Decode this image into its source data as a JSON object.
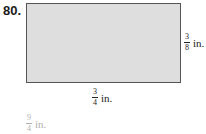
{
  "problem": {
    "number": "80.",
    "shape": "rectangle",
    "fill_color": "#dedede",
    "border_color": "#555555",
    "height_label": {
      "numerator": "3",
      "denominator": "8",
      "unit": "in."
    },
    "width_label": {
      "numerator": "3",
      "denominator": "4",
      "unit": "in."
    }
  },
  "answer": {
    "numerator": "9",
    "denominator": "4",
    "unit": "in."
  }
}
